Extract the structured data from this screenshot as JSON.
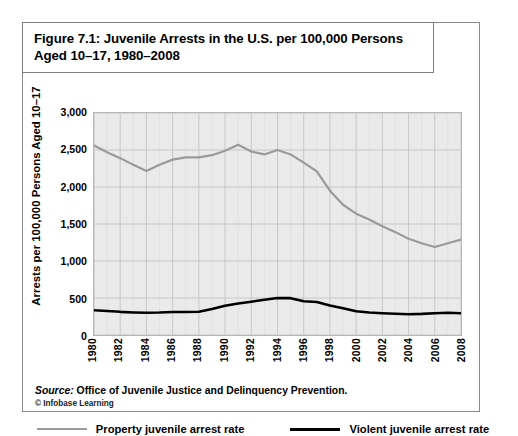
{
  "figure": {
    "title": "Figure 7.1: Juvenile Arrests in the U.S. per 100,000 Persons Aged 10–17, 1980–2008",
    "source_prefix": "Source:",
    "source_text": " Office of Juvenile Justice and Delinquency Prevention.",
    "copyright": "© Infobase Learning"
  },
  "colors": {
    "property_line": "#9a9a9a",
    "violent_line": "#000000",
    "plot_background": "#eaeaea",
    "grid_major": "#c4c4c4",
    "grid_minor": "#dcdcdc",
    "frame": "#8a8a8a"
  },
  "chart_data": {
    "type": "line",
    "title": "Figure 7.1: Juvenile Arrests in the U.S. per 100,000 Persons Aged 10–17, 1980–2008",
    "xlabel": "",
    "ylabel": "Arrests per 100,000 Persons Aged 10–17",
    "ylim": [
      0,
      3000
    ],
    "xlim": [
      1980,
      2008
    ],
    "yticks": [
      0,
      500,
      1000,
      1500,
      2000,
      2500,
      3000
    ],
    "ytick_labels": [
      "0",
      "500",
      "1,000",
      "1,500",
      "2,000",
      "2,500",
      "3,000"
    ],
    "xticks": [
      1980,
      1982,
      1984,
      1986,
      1988,
      1990,
      1992,
      1994,
      1996,
      1998,
      2000,
      2002,
      2004,
      2006,
      2008
    ],
    "xtick_labels": [
      "1980",
      "1982",
      "1984",
      "1986",
      "1988",
      "1990",
      "1992",
      "1994",
      "1996",
      "1998",
      "2000",
      "2002",
      "2004",
      "2006",
      "2008"
    ],
    "grid": true,
    "legend_position": "bottom",
    "x": [
      1980,
      1981,
      1982,
      1983,
      1984,
      1985,
      1986,
      1987,
      1988,
      1989,
      1990,
      1991,
      1992,
      1993,
      1994,
      1995,
      1996,
      1997,
      1998,
      1999,
      2000,
      2001,
      2002,
      2003,
      2004,
      2005,
      2006,
      2007,
      2008
    ],
    "series": [
      {
        "name": "Property juvenile arrest rate",
        "color": "#9a9a9a",
        "values": [
          2560,
          2470,
          2390,
          2300,
          2215,
          2300,
          2370,
          2400,
          2400,
          2430,
          2490,
          2570,
          2480,
          2440,
          2500,
          2440,
          2330,
          2210,
          1950,
          1760,
          1640,
          1560,
          1470,
          1390,
          1300,
          1240,
          1190,
          1240,
          1290
        ]
      },
      {
        "name": "Violent juvenile arrest rate",
        "color": "#000000",
        "values": [
          335,
          325,
          313,
          305,
          300,
          303,
          310,
          310,
          315,
          350,
          395,
          425,
          450,
          475,
          500,
          498,
          455,
          445,
          400,
          360,
          320,
          305,
          295,
          288,
          280,
          285,
          295,
          300,
          295
        ]
      }
    ]
  },
  "legend": {
    "items": [
      {
        "label": "Property juvenile arrest rate",
        "color": "#9a9a9a",
        "thickness": 2
      },
      {
        "label": "Violent juvenile arrest rate",
        "color": "#000000",
        "thickness": 3
      }
    ]
  }
}
